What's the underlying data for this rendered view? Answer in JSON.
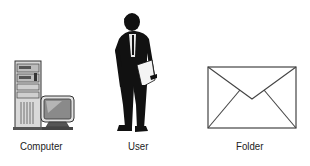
{
  "diagram": {
    "nodes": [
      {
        "id": "computer",
        "label": "Computer",
        "icon": "computer-icon"
      },
      {
        "id": "user",
        "label": "User",
        "icon": "user-icon"
      },
      {
        "id": "folder",
        "label": "Folder",
        "icon": "envelope-icon"
      }
    ],
    "colors": {
      "stroke": "#333333",
      "silhouette": "#111111",
      "screen": "#8a8a8a",
      "case": "#d8d8d8"
    }
  }
}
